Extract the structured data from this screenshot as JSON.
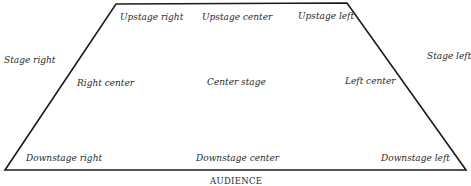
{
  "diagram": {
    "type": "stage-directions",
    "outline_color": "#1a1a1a",
    "shape": {
      "top_left": [
        116,
        4
      ],
      "top_right": [
        347,
        3
      ],
      "bottom_right": [
        466,
        170
      ],
      "bottom_left": [
        5,
        170
      ]
    },
    "labels": {
      "upstage_right": "Upstage right",
      "upstage_center": "Upstage center",
      "upstage_left": "Upstage left",
      "stage_right": "Stage right",
      "stage_left": "Stage left",
      "right_center": "Right center",
      "center_stage": "Center stage",
      "left_center": "Left center",
      "downstage_right": "Downstage right",
      "downstage_center": "Downstage center",
      "downstage_left": "Downstage left",
      "audience": "AUDIENCE"
    }
  }
}
